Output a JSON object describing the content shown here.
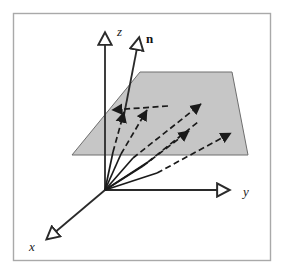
{
  "figure": {
    "background_color": "#ffffff",
    "frame": {
      "name": "figure-border",
      "x": 13,
      "y": 13,
      "width": 258,
      "height": 248,
      "stroke_color": "#a9a9a9",
      "stroke_width": 1.4,
      "fill": "#ffffff"
    },
    "origin": {
      "x": 105,
      "y": 190
    }
  },
  "axes": [
    {
      "id": "z-axis",
      "label": "z",
      "label_x": 117,
      "label_y": 36,
      "from": {
        "x": 105,
        "y": 190
      },
      "to": {
        "x": 105,
        "y": 33
      },
      "stroke_color": "#2a2a2a",
      "stroke_width": 1.8,
      "arrowhead": "hollow"
    },
    {
      "id": "y-axis",
      "label": "y",
      "label_x": 243,
      "label_y": 196,
      "from": {
        "x": 105,
        "y": 190
      },
      "to": {
        "x": 229,
        "y": 190
      },
      "stroke_color": "#2a2a2a",
      "stroke_width": 1.8,
      "arrowhead": "hollow"
    },
    {
      "id": "x-axis",
      "label": "x",
      "label_x": 29,
      "label_y": 251,
      "from": {
        "x": 105,
        "y": 190
      },
      "to": {
        "x": 47,
        "y": 239
      },
      "stroke_color": "#2a2a2a",
      "stroke_width": 1.8,
      "arrowhead": "hollow"
    }
  ],
  "normal_vector": {
    "id": "normal-vector-n",
    "label": "n",
    "label_x": 146,
    "label_y": 43,
    "from": {
      "x": 124,
      "y": 115
    },
    "to": {
      "x": 139,
      "y": 38
    },
    "stroke_color": "#2a2a2a",
    "stroke_width": 1.8,
    "arrowhead": "hollow"
  },
  "plane": {
    "id": "shaded-plane",
    "points": "72,155 140,72 232,72 248,155",
    "fill_color": "#c6c6c6",
    "stroke_color": "#6e6e6e",
    "stroke_width": 1.0
  },
  "rays": [
    {
      "id": "ray-1",
      "solid_from": {
        "x": 105,
        "y": 190
      },
      "solid_to": {
        "x": 113,
        "y": 152
      },
      "dashed_to": {
        "x": 124,
        "y": 112
      },
      "arrowhead": "filled",
      "dash": "6,3.5"
    },
    {
      "id": "ray-2",
      "solid_from": {
        "x": 105,
        "y": 190
      },
      "solid_to": {
        "x": 121,
        "y": 154
      },
      "dashed_to": {
        "x": 147,
        "y": 110
      },
      "arrowhead": "filled",
      "dash": "6,3.5"
    },
    {
      "id": "ray-3",
      "solid_from": {
        "x": 105,
        "y": 190
      },
      "solid_to": {
        "x": 133,
        "y": 158
      },
      "dashed_to": {
        "x": 201,
        "y": 104
      },
      "arrowhead": "filled",
      "dash": "6,3.5"
    },
    {
      "id": "ray-4",
      "solid_from": {
        "x": 105,
        "y": 190
      },
      "solid_to": {
        "x": 143,
        "y": 166
      },
      "dashed_to": {
        "x": 189,
        "y": 131
      },
      "arrowhead": "filled",
      "dash": "6,3.5"
    },
    {
      "id": "ray-5",
      "solid_from": {
        "x": 105,
        "y": 190
      },
      "solid_to": {
        "x": 157,
        "y": 173
      },
      "dashed_to": {
        "x": 231,
        "y": 133
      },
      "arrowhead": "filled",
      "dash": "6,3.5"
    },
    {
      "id": "ray-6",
      "solid_from": {
        "x": 105,
        "y": 190
      },
      "solid_to": {
        "x": 148,
        "y": 162
      },
      "dashed_to": {
        "x": 198,
        "y": 122
      },
      "arrowhead": "none",
      "dash": "6,3.5"
    }
  ],
  "projection_segment": {
    "id": "projection-arrow",
    "from": {
      "x": 168,
      "y": 106
    },
    "to": {
      "x": 112,
      "y": 110
    },
    "arrowhead": "filled",
    "dash": "6,3.5",
    "stroke_color": "#1a1a1a",
    "stroke_width": 1.7
  },
  "colors": {
    "ink": "#1a1a1a",
    "axis": "#2a2a2a",
    "plane_fill": "#c6c6c6",
    "plane_edge": "#6e6e6e",
    "frame": "#a9a9a9",
    "page": "#ffffff"
  }
}
